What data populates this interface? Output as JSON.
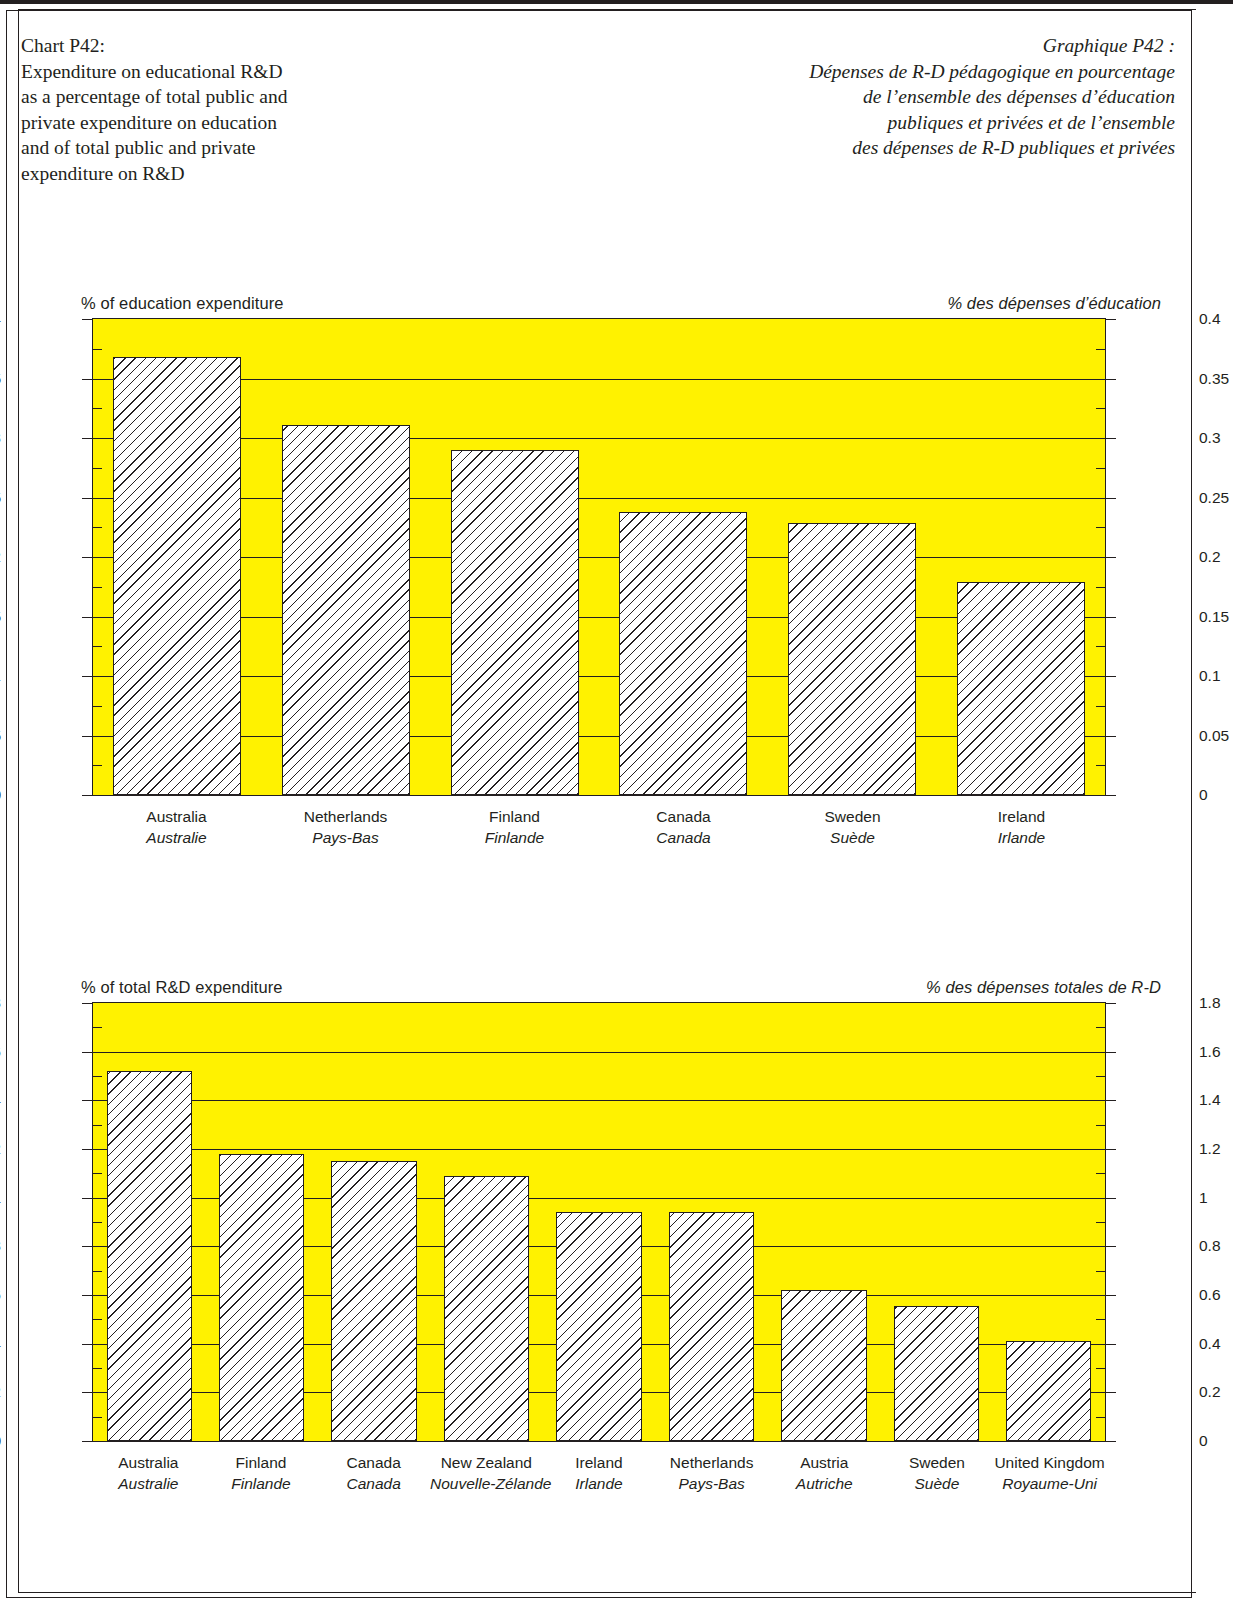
{
  "titles": {
    "en": "Chart P42:\nExpenditure on educational R&D\nas a percentage of total public and\nprivate expenditure on education\nand of total public and private\nexpenditure on R&D",
    "fr": "Graphique P42 :\nDépenses de R-D pédagogique en pourcentage\nde l’ensemble des dépenses d’éducation\npubliques et privées et de l’ensemble\ndes dépenses de R-D publiques et privées"
  },
  "colors": {
    "plot_background": "#FFF200",
    "ink": "#231f20",
    "bar_fill": "#ffffff"
  },
  "chart_data": [
    {
      "type": "bar",
      "id": "education-expenditure",
      "title": "",
      "caption_left": "% of education expenditure",
      "caption_right": "% des dépenses d’éducation",
      "xlabel": "",
      "ylabel": "% of education expenditure",
      "ylim": [
        0,
        0.4
      ],
      "ytick_step": 0.05,
      "yticks": [
        "0",
        "0.05",
        "0.1",
        "0.15",
        "0.2",
        "0.25",
        "0.3",
        "0.35",
        "0.4"
      ],
      "ytick_values": [
        0,
        0.05,
        0.1,
        0.15,
        0.2,
        0.25,
        0.3,
        0.35,
        0.4
      ],
      "grid": true,
      "legend": "none",
      "categories": [
        "Australia",
        "Netherlands",
        "Finland",
        "Canada",
        "Sweden",
        "Ireland"
      ],
      "categories_fr": [
        "Australie",
        "Pays-Bas",
        "Finlande",
        "Canada",
        "Suède",
        "Irlande"
      ],
      "values": [
        0.368,
        0.311,
        0.29,
        0.238,
        0.229,
        0.179
      ]
    },
    {
      "type": "bar",
      "id": "total-rd-expenditure",
      "title": "",
      "caption_left": "% of total R&D expenditure",
      "caption_right": "% des dépenses totales de R-D",
      "xlabel": "",
      "ylabel": "% of total R&D expenditure",
      "ylim": [
        0,
        1.8
      ],
      "ytick_step": 0.2,
      "yticks": [
        "0",
        "0.2",
        "0.4",
        "0.6",
        "0.8",
        "1",
        "1.2",
        "1.4",
        "1.6",
        "1.8"
      ],
      "ytick_values": [
        0,
        0.2,
        0.4,
        0.6,
        0.8,
        1.0,
        1.2,
        1.4,
        1.6,
        1.8
      ],
      "grid": true,
      "legend": "none",
      "categories": [
        "Australia",
        "Finland",
        "Canada",
        "New Zealand",
        "Ireland",
        "Netherlands",
        "Austria",
        "Sweden",
        "United Kingdom"
      ],
      "categories_fr": [
        "Australie",
        "Finlande",
        "Canada",
        "Nouvelle-Zélande",
        "Irlande",
        "Pays-Bas",
        "Autriche",
        "Suède",
        "Royaume-Uni"
      ],
      "values": [
        1.52,
        1.18,
        1.15,
        1.09,
        0.94,
        0.94,
        0.62,
        0.555,
        0.41
      ]
    }
  ]
}
